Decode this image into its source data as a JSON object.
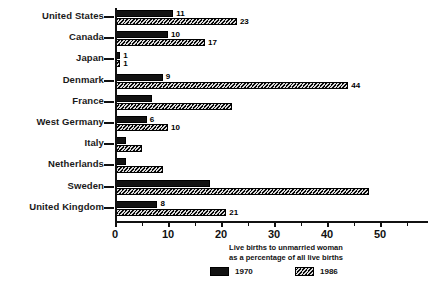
{
  "chart_data": {
    "type": "bar",
    "orientation": "horizontal",
    "title": "",
    "xlabel": "Live births to unmarried woman as a percentage of all live births",
    "ylabel": "",
    "xlim": [
      0,
      57
    ],
    "grid": false,
    "legend_position": "bottom",
    "categories": [
      "United States",
      "Canada",
      "Japan",
      "Denmark",
      "France",
      "West Germany",
      "Italy",
      "Netherlands",
      "Sweden",
      "United Kingdom"
    ],
    "series": [
      {
        "name": "1970",
        "values": [
          11,
          10,
          1,
          9,
          7,
          6,
          2,
          2,
          18,
          8
        ],
        "labels": [
          "11",
          "10",
          "1",
          "9",
          "",
          "6",
          "",
          "",
          "",
          "8"
        ],
        "color": "#121212"
      },
      {
        "name": "1986",
        "values": [
          23,
          17,
          1,
          44,
          22,
          10,
          5,
          9,
          48,
          21
        ],
        "labels": [
          "23",
          "17",
          "1",
          "44",
          "",
          "10",
          "",
          "",
          "",
          "21"
        ],
        "color": "#6b6b6b"
      }
    ],
    "xticks": [
      0,
      10,
      20,
      30,
      40,
      50
    ],
    "xtick_labels": [
      "0",
      "10",
      "20",
      "30",
      "40",
      "50"
    ]
  },
  "axis_title": {
    "line1": "Live births to unmarried woman",
    "line2": "as a percentage of all live births"
  },
  "legend": {
    "items": [
      {
        "label": "1970",
        "swatch": "solid-black"
      },
      {
        "label": "1986",
        "swatch": "hatched-gray"
      }
    ]
  },
  "caption": {
    "fragment": ""
  }
}
